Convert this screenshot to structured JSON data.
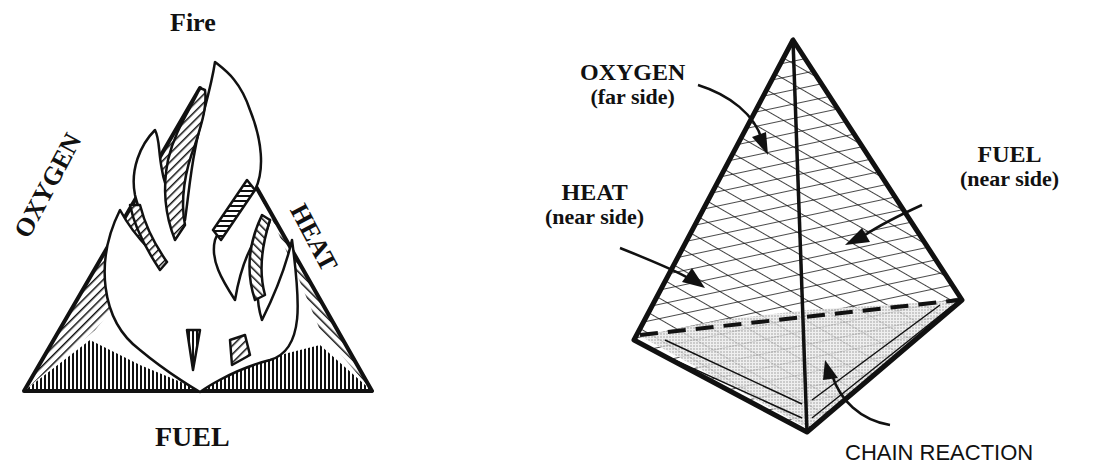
{
  "fire_triangle": {
    "title": "Fire",
    "sides": {
      "left": "OXYGEN",
      "right": "HEAT",
      "bottom": "FUEL"
    }
  },
  "fire_tetrahedron": {
    "faces": [
      {
        "name": "OXYGEN",
        "note": "(far side)"
      },
      {
        "name": "HEAT",
        "note": "(near side)"
      },
      {
        "name": "FUEL",
        "note": "(near side)"
      },
      {
        "name": "CHAIN REACTION",
        "note": ""
      }
    ]
  },
  "colors": {
    "ink": "#111111",
    "background": "#ffffff",
    "stipple": "#bdbdbd"
  }
}
